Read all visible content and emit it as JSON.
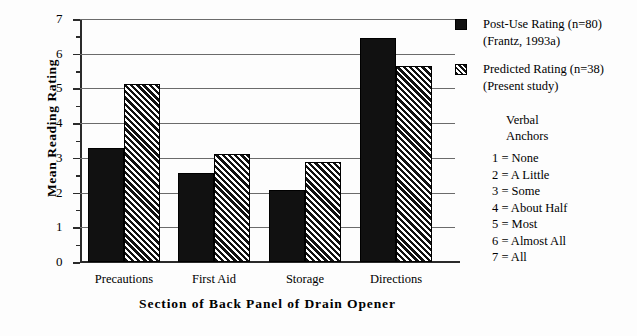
{
  "chart_data": {
    "type": "bar",
    "title": "",
    "xlabel": "Section of Back Panel of Drain Opener",
    "ylabel": "Mean Reading Rating",
    "categories": [
      "Precautions",
      "First Aid",
      "Storage",
      "Directions"
    ],
    "series": [
      {
        "name": "Post-Use Rating (n=80)",
        "source": "(Frantz, 1993a)",
        "fill": "solid-black",
        "values": [
          3.28,
          2.55,
          2.08,
          6.45
        ]
      },
      {
        "name": "Predicted Rating (n=38)",
        "source": "(Present study)",
        "fill": "diagonal-hatch",
        "values": [
          5.14,
          3.1,
          2.88,
          5.65
        ]
      }
    ],
    "ylim": [
      0,
      7
    ],
    "yticks": [
      0,
      1,
      2,
      3,
      4,
      5,
      6,
      7
    ],
    "ytick_labels": [
      "0",
      "1",
      "2",
      "3",
      "4",
      "5",
      "6",
      "7"
    ],
    "yminor_ticks": [
      0.5,
      1.5,
      2.5,
      3.5,
      4.5,
      5.5,
      6.5
    ],
    "grid": "horizontal",
    "legend_position": "top-right"
  },
  "legend": {
    "entries": [
      {
        "label": "Post-Use Rating (n=80)",
        "sublabel": "(Frantz, 1993a)",
        "swatch": "solid-black"
      },
      {
        "label": "Predicted Rating (n=38)",
        "sublabel": "(Present study)",
        "swatch": "diagonal-hatch"
      }
    ]
  },
  "anchors": {
    "title_line1": "Verbal",
    "title_line2": "Anchors",
    "items": [
      "1 = None",
      "2 = A Little",
      "3 = Some",
      "4 = About Half",
      "5 = Most",
      "6 = Almost All",
      "7 = All"
    ]
  },
  "colors": {
    "bar_solid": "#111111",
    "bar_hatch": "#111111",
    "gridline": "#6b6b6b",
    "axis": "#2a2a2a",
    "background": "#fdfdfd"
  }
}
